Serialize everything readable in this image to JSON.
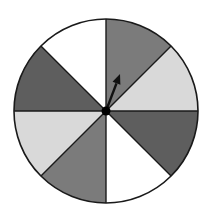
{
  "spinner": {
    "center": {
      "x": 106,
      "y": 111
    },
    "radius": 92,
    "outline_color": "#1a1a1a",
    "divider_color": "#1a1a1a",
    "sections": [
      {
        "index": 1,
        "start_deg": 0,
        "end_deg": 45,
        "shade": "medium-gray",
        "color": "#7b7b7b"
      },
      {
        "index": 2,
        "start_deg": 45,
        "end_deg": 90,
        "shade": "light-gray",
        "color": "#d9d9d9"
      },
      {
        "index": 3,
        "start_deg": 90,
        "end_deg": 135,
        "shade": "dark-gray",
        "color": "#5e5e5e"
      },
      {
        "index": 4,
        "start_deg": 135,
        "end_deg": 180,
        "shade": "white",
        "color": "#ffffff"
      },
      {
        "index": 5,
        "start_deg": 180,
        "end_deg": 225,
        "shade": "medium-gray",
        "color": "#7b7b7b"
      },
      {
        "index": 6,
        "start_deg": 225,
        "end_deg": 270,
        "shade": "light-gray",
        "color": "#d9d9d9"
      },
      {
        "index": 7,
        "start_deg": 270,
        "end_deg": 315,
        "shade": "dark-gray",
        "color": "#5e5e5e"
      },
      {
        "index": 8,
        "start_deg": 315,
        "end_deg": 360,
        "shade": "white",
        "color": "#ffffff"
      }
    ],
    "arrow": {
      "color": "#111111",
      "tip": {
        "x": 120,
        "y": 74
      },
      "points_to_section": 1
    },
    "hub": {
      "color": "#000000",
      "radius": 4.5
    }
  }
}
